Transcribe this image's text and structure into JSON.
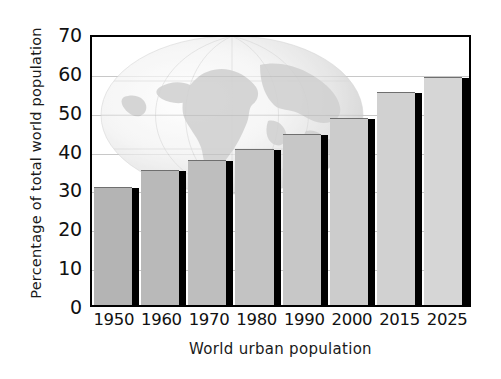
{
  "chart_data": {
    "type": "bar",
    "title": "",
    "xlabel": "World urban population",
    "ylabel": "Percentage of total world population",
    "categories": [
      "1950",
      "1960",
      "1970",
      "1980",
      "1990",
      "2000",
      "2015",
      "2025"
    ],
    "values": [
      30,
      34.5,
      37,
      40,
      43.7,
      48,
      54.5,
      58.5
    ],
    "ylim": [
      0,
      70
    ],
    "ytick_labels": [
      "0",
      "10",
      "20",
      "30",
      "40",
      "50",
      "60",
      "70"
    ],
    "ytick_values": [
      0,
      10,
      20,
      30,
      40,
      50,
      60,
      70
    ],
    "grid": true,
    "legend": "none",
    "series": [
      {
        "name": "Percentage of total world population",
        "values": [
          30,
          34.5,
          37,
          40,
          43.7,
          48,
          54.5,
          58.5
        ]
      }
    ],
    "annotations": [
      "globe watermark behind bars"
    ],
    "colors": {
      "bar_fill_left": "#b4b4b4",
      "bar_fill_right": "#d6d6d6",
      "bar_shadow": "#000000",
      "axis": "#000000",
      "gridline": "#9a9a9a",
      "background": "#ffffff",
      "text": "#111111"
    }
  },
  "decoration": {
    "globe_icon": "globe-watermark"
  }
}
